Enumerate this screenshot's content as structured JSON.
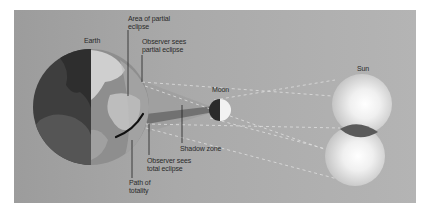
{
  "diagram": {
    "type": "solar-eclipse-geometry",
    "labels": {
      "earth": "Earth",
      "area_partial": "Area of partial\neclipse",
      "observer_partial": "Observer sees\npartial eclipse",
      "moon": "Moon",
      "sun": "Sun",
      "shadow_zone": "Shadow zone",
      "observer_total": "Observer sees\ntotal eclipse",
      "path_totality": "Path of\ntotality"
    },
    "colors": {
      "panel": "#a9a9a9",
      "earth_night": "#3e3e3e",
      "earth_day": "#8a8a8a",
      "land_day": "#c8c8c8",
      "moon_dark": "#2a2a2a",
      "moon_light": "#f2f2f2",
      "sun": "#f4f4f4",
      "umbra": "#6a6a6a",
      "penumbra": "#9a9a9a",
      "path_totality": "#111111"
    }
  }
}
